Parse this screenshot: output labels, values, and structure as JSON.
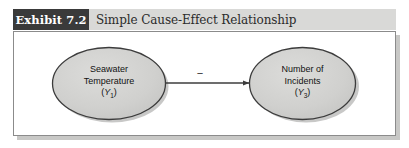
{
  "exhibit": {
    "badge_label": "Exhibit 7.2",
    "title": "Simple Cause-Effect Relationship"
  },
  "diagram": {
    "type": "cause-effect-path-diagram",
    "nodes": [
      {
        "id": "cause",
        "shape": "ellipse",
        "line1": "Seawater",
        "line2": "Temperature",
        "variable_open": "(",
        "variable_symbol": "Y",
        "variable_subscript": "1",
        "variable_close": ")"
      },
      {
        "id": "effect",
        "shape": "ellipse",
        "line1": "Number of",
        "line2": "Incidents",
        "variable_open": "(",
        "variable_symbol": "Y",
        "variable_subscript": "3",
        "variable_close": ")"
      }
    ],
    "link": {
      "from": "cause",
      "to": "effect",
      "direction": "right",
      "sign_label": "−"
    }
  },
  "colors": {
    "badge_background": "#3a3a3a",
    "badge_text": "#ffffff",
    "header_band": "#d9d9d7",
    "title_text": "#2b2b2b",
    "panel_background": "#ffffff",
    "panel_border": "#8b8b8b",
    "panel_shadow": "#c8c8c6",
    "node_fill": "#cfcfcd",
    "node_stroke": "#3c3c3c",
    "node_shadow": "#b4b4b2",
    "link_stroke": "#3c3c3c"
  }
}
